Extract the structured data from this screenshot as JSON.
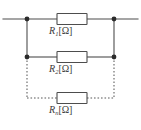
{
  "diagram": {
    "colors": {
      "wire": "#4d4d4d",
      "dotted_wire": "#5a5a5a",
      "node": "#2b2b2b",
      "background": "#ffffff",
      "label_text": "#3a3a3a"
    },
    "branches": [
      {
        "id": "branch-1",
        "resistor_name": "R1",
        "symbol": "R",
        "subscript": "1",
        "unit": "[Ω]",
        "line_style": "solid"
      },
      {
        "id": "branch-2",
        "resistor_name": "R2",
        "symbol": "R",
        "subscript": "2",
        "unit": "[Ω]",
        "line_style": "solid"
      },
      {
        "id": "branch-n",
        "resistor_name": "Rn",
        "symbol": "R",
        "subscript": "n",
        "unit": "[Ω]",
        "line_style": "dotted"
      }
    ],
    "nodes": [
      {
        "id": "node-top-left",
        "label": "junction"
      },
      {
        "id": "node-top-right",
        "label": "junction"
      },
      {
        "id": "node-mid-left",
        "label": "junction"
      },
      {
        "id": "node-mid-right",
        "label": "junction"
      }
    ]
  }
}
